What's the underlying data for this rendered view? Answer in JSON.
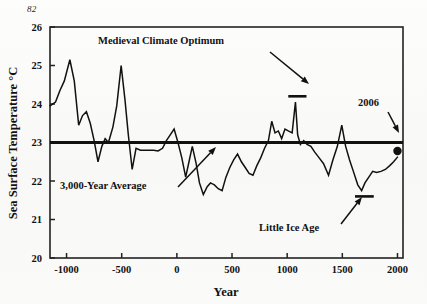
{
  "folio": {
    "page_number": "82"
  },
  "chart_data": {
    "type": "line",
    "title": "",
    "xlabel": "Year",
    "ylabel": "Sea Surface Temperature °C",
    "xlim": [
      -1150,
      2050
    ],
    "ylim": [
      20,
      26
    ],
    "xticks": [
      -1000,
      -500,
      0,
      500,
      1000,
      1500,
      2000
    ],
    "xticklabels": [
      "-1000",
      "-500",
      "0",
      "500",
      "1000",
      "1500",
      "2000"
    ],
    "yticks": [
      20,
      21,
      22,
      23,
      24,
      25,
      26
    ],
    "yticklabels": [
      "20",
      "21",
      "22",
      "23",
      "24",
      "25",
      "26"
    ],
    "grid": false,
    "legend": "none",
    "series": [
      {
        "name": "Sea surface temperature",
        "x": [
          -1150,
          -1100,
          -1060,
          -1020,
          -970,
          -930,
          -890,
          -855,
          -820,
          -785,
          -750,
          -715,
          -680,
          -650,
          -620,
          -580,
          -545,
          -505,
          -470,
          -440,
          -405,
          -370,
          -330,
          -290,
          -250,
          -210,
          -170,
          -130,
          -95,
          -60,
          -25,
          10,
          45,
          80,
          110,
          140,
          175,
          205,
          240,
          275,
          305,
          340,
          375,
          410,
          445,
          480,
          515,
          550,
          585,
          620,
          655,
          690,
          725,
          760,
          795,
          830,
          860,
          890,
          920,
          950,
          980,
          1010,
          1045,
          1075,
          1095,
          1120,
          1150,
          1180,
          1215,
          1250,
          1290,
          1330,
          1375,
          1415,
          1455,
          1495,
          1530,
          1565,
          1600,
          1640,
          1675,
          1705,
          1740,
          1775,
          1810,
          1850,
          1890,
          1930,
          1965,
          2000
        ],
        "y": [
          23.95,
          24.05,
          24.35,
          24.6,
          25.15,
          24.6,
          23.45,
          23.7,
          23.8,
          23.5,
          23.05,
          22.5,
          22.9,
          23.1,
          23.0,
          23.4,
          23.95,
          25.0,
          24.1,
          23.2,
          22.3,
          22.85,
          22.8,
          22.8,
          22.8,
          22.8,
          22.78,
          22.85,
          23.05,
          23.2,
          23.35,
          23.0,
          22.6,
          22.1,
          22.5,
          22.9,
          22.45,
          21.95,
          21.65,
          21.85,
          21.95,
          21.9,
          21.8,
          21.75,
          22.1,
          22.35,
          22.55,
          22.7,
          22.5,
          22.35,
          22.2,
          22.15,
          22.4,
          22.6,
          22.85,
          23.05,
          23.55,
          23.25,
          23.3,
          23.1,
          23.35,
          23.3,
          23.25,
          24.05,
          23.2,
          22.95,
          23.05,
          22.95,
          22.9,
          22.75,
          22.6,
          22.45,
          22.15,
          22.55,
          22.9,
          23.45,
          22.9,
          22.55,
          22.25,
          21.9,
          21.75,
          21.95,
          22.1,
          22.25,
          22.22,
          22.25,
          22.3,
          22.4,
          22.5,
          22.62
        ]
      }
    ],
    "reference_line": {
      "label": "3,000-Year Average",
      "value": 23.0
    },
    "point_markers": [
      {
        "label": "2006",
        "x": 2000,
        "y": 22.78
      }
    ],
    "period_bars": [
      {
        "label": "Medieval Climate Optimum",
        "x_start": 1010,
        "x_end": 1175,
        "y": 24.2
      },
      {
        "label": "Little Ice Age",
        "x_start": 1615,
        "x_end": 1785,
        "y": 21.6
      }
    ],
    "annotations": [
      {
        "text": "Medieval Climate Optimum",
        "text_x": 98,
        "text_y": 44,
        "arrow_from_x": 270,
        "arrow_from_y": 52,
        "arrow_to_x": 309,
        "arrow_to_y": 84
      },
      {
        "text": "3,000-Year Average",
        "text_x": 60,
        "text_y": 189,
        "arrow_from_x": 178,
        "arrow_from_y": 187,
        "arrow_to_x": 216,
        "arrow_to_y": 147
      },
      {
        "text": "Little Ice Age",
        "text_x": 259,
        "text_y": 231,
        "arrow_from_x": 341,
        "arrow_from_y": 224,
        "arrow_to_x": 362,
        "arrow_to_y": 197
      },
      {
        "text": "2006",
        "text_x": 358,
        "text_y": 106,
        "arrow_from_x": 388,
        "arrow_from_y": 112,
        "arrow_to_x": 399,
        "arrow_to_y": 133
      }
    ],
    "colors": {
      "line": "#111111",
      "reference_line": "#111111",
      "axis": "#222222",
      "text": "#111111",
      "background": "#fbfbfa"
    }
  }
}
